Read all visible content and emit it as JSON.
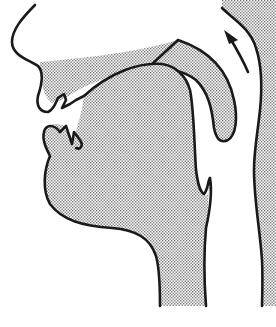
{
  "diagram": {
    "type": "vocal-tract-sagittal-section",
    "parts": [
      {
        "id": "nose",
        "label": ""
      },
      {
        "id": "upper-lip",
        "label": ""
      },
      {
        "id": "lower-lip",
        "label": ""
      },
      {
        "id": "upper-teeth",
        "label": ""
      },
      {
        "id": "lower-teeth",
        "label": ""
      },
      {
        "id": "hard-palate",
        "label": ""
      },
      {
        "id": "velum",
        "label": ""
      },
      {
        "id": "tongue",
        "label": ""
      },
      {
        "id": "epiglottis",
        "label": ""
      },
      {
        "id": "pharynx-wall",
        "label": ""
      },
      {
        "id": "nasal-airflow-arrow",
        "label": ""
      }
    ],
    "colors": {
      "outline": "#1a1a1a",
      "stipple": "#8a8a8a",
      "background": "#ffffff"
    }
  }
}
